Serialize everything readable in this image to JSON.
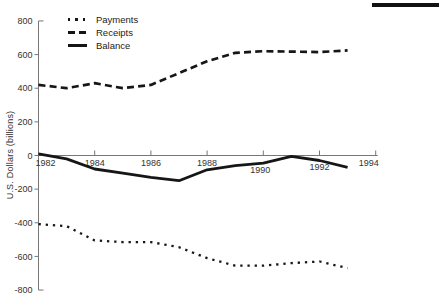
{
  "decor": {
    "top_right_bar_color": "#111111"
  },
  "chart_data": {
    "type": "line",
    "title": "",
    "xlabel": "",
    "ylabel": "U.S. Dollars (billions)",
    "x": [
      1982,
      1983,
      1984,
      1985,
      1986,
      1987,
      1988,
      1989,
      1990,
      1991,
      1992,
      1993
    ],
    "series": [
      {
        "name": "Payments",
        "style": "dotted",
        "values": [
          -408,
          -420,
          -505,
          -515,
          -515,
          -545,
          -610,
          -655,
          -655,
          -640,
          -630,
          -670
        ]
      },
      {
        "name": "Receipts",
        "style": "dashed",
        "values": [
          420,
          400,
          430,
          400,
          420,
          490,
          560,
          610,
          620,
          618,
          615,
          625
        ]
      },
      {
        "name": "Balance",
        "style": "solid",
        "values": [
          10,
          -20,
          -80,
          -105,
          -130,
          -150,
          -85,
          -60,
          -45,
          -5,
          -30,
          -70
        ]
      }
    ],
    "ylim": [
      -800,
      800
    ],
    "yticks": [
      800,
      600,
      400,
      200,
      0,
      -200,
      -400,
      -600,
      -800
    ],
    "xticks": [
      1982,
      1984,
      1986,
      1988,
      1990,
      1992,
      1994
    ],
    "grid": false,
    "legend_position": "top-left-inside",
    "line_color": "#161616",
    "axis_color": "#777777",
    "tick_text_color": "#333333"
  }
}
